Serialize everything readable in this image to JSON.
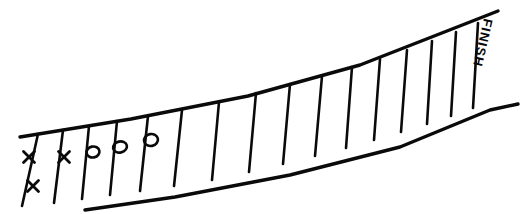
{
  "canvas": {
    "width": 523,
    "height": 214,
    "background_color": "#ffffff",
    "ink_color": "#0a0a0a",
    "style": "hand-drawn"
  },
  "board": {
    "name": "race-track-board",
    "description": "Hand-drawn board game track rising from lower-left to upper-right",
    "finish_label": "FINISH",
    "finish_label_rotation_degrees": 90,
    "cell_count": 16,
    "track_edges": {
      "top_edge_path": "M 20,137 L 131,119 L 248,96 L 360,65 L 470,22 L 498,11",
      "bottom_edge_path": "M 85,210 L 175,197 L 290,175 L 400,147 L 490,110 L 518,104"
    },
    "dividers": [
      {
        "name": "divider-1",
        "x_top": 38,
        "y_top": 134,
        "x_bottom": 22,
        "y_bottom": 206
      },
      {
        "name": "divider-2",
        "x_top": 63,
        "y_top": 130,
        "x_bottom": 54,
        "y_bottom": 203
      },
      {
        "name": "divider-3",
        "x_top": 89,
        "y_top": 126,
        "x_bottom": 82,
        "y_bottom": 199
      },
      {
        "name": "divider-4",
        "x_top": 117,
        "y_top": 121,
        "x_bottom": 110,
        "y_bottom": 195
      },
      {
        "name": "divider-5",
        "x_top": 148,
        "y_top": 116,
        "x_bottom": 140,
        "y_bottom": 191
      },
      {
        "name": "divider-6",
        "x_top": 182,
        "y_top": 110,
        "x_bottom": 174,
        "y_bottom": 186
      },
      {
        "name": "divider-7",
        "x_top": 219,
        "y_top": 102,
        "x_bottom": 212,
        "y_bottom": 180
      },
      {
        "name": "divider-8",
        "x_top": 256,
        "y_top": 93,
        "x_bottom": 249,
        "y_bottom": 172
      },
      {
        "name": "divider-9",
        "x_top": 290,
        "y_top": 84,
        "x_bottom": 283,
        "y_bottom": 164
      },
      {
        "name": "divider-10",
        "x_top": 322,
        "y_top": 76,
        "x_bottom": 315,
        "y_bottom": 156
      },
      {
        "name": "divider-11",
        "x_top": 352,
        "y_top": 67,
        "x_bottom": 346,
        "y_bottom": 148
      },
      {
        "name": "divider-12",
        "x_top": 380,
        "y_top": 59,
        "x_bottom": 374,
        "y_bottom": 140
      },
      {
        "name": "divider-13",
        "x_top": 407,
        "y_top": 50,
        "x_bottom": 401,
        "y_bottom": 132
      },
      {
        "name": "divider-14",
        "x_top": 432,
        "y_top": 41,
        "x_bottom": 427,
        "y_bottom": 124
      },
      {
        "name": "divider-15",
        "x_top": 456,
        "y_top": 32,
        "x_bottom": 451,
        "y_bottom": 116
      },
      {
        "name": "divider-16",
        "x_top": 478,
        "y_top": 23,
        "x_bottom": 473,
        "y_bottom": 108
      }
    ],
    "marks": [
      {
        "name": "mark-x-1",
        "symbol": "X",
        "cell": "start-zone",
        "cx": 29,
        "cy": 157,
        "size": 11
      },
      {
        "name": "mark-x-2",
        "symbol": "X",
        "cell": "start-zone",
        "cx": 33,
        "cy": 186,
        "size": 11
      },
      {
        "name": "mark-x-3",
        "symbol": "X",
        "cell": 1,
        "cx": 64,
        "cy": 157,
        "size": 11
      },
      {
        "name": "mark-o-1",
        "symbol": "O",
        "cell": 2,
        "cx": 93,
        "cy": 152,
        "rx": 6.5,
        "ry": 5.5
      },
      {
        "name": "mark-o-2",
        "symbol": "O",
        "cell": 3,
        "cx": 120,
        "cy": 147,
        "rx": 7.0,
        "ry": 5.5
      },
      {
        "name": "mark-o-3",
        "symbol": "O",
        "cell": 4,
        "cx": 151,
        "cy": 140,
        "rx": 7.0,
        "ry": 6.0
      }
    ],
    "legend": {
      "x_symbol": "X",
      "o_symbol": "O"
    }
  }
}
